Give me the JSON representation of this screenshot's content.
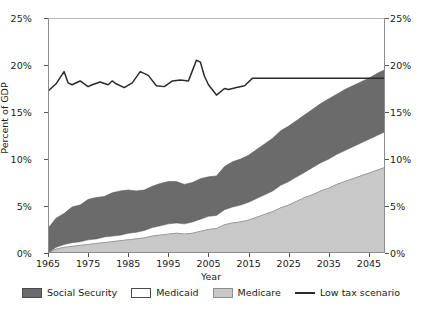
{
  "chart_data": {
    "type": "area",
    "title": "",
    "subtitle": "",
    "xlabel": "Year",
    "ylabel": "Percent of GDP",
    "xlim": [
      1965,
      2049
    ],
    "ylim": [
      0,
      25
    ],
    "grid": false,
    "legend_position": "bottom",
    "y_tick_labels": [
      "0%",
      "5%",
      "10%",
      "15%",
      "20%",
      "25%"
    ],
    "y_tick_values": [
      0,
      5,
      10,
      15,
      20,
      25
    ],
    "y_axis_right_labels": [
      "0%",
      "5%",
      "10%",
      "15%",
      "20%",
      "25%"
    ],
    "x_tick_labels": [
      "1965",
      "1975",
      "1985",
      "1995",
      "2005",
      "2015",
      "2025",
      "2035",
      "2045"
    ],
    "x_tick_values": [
      1965,
      1975,
      1985,
      1995,
      2005,
      2015,
      2025,
      2035,
      2045
    ],
    "stacked_order": [
      "Medicare",
      "Medicaid",
      "Social Security"
    ],
    "colors": {
      "social_security": "#6b6b6b",
      "medicaid": "#ffffff",
      "medicare": "#c8c8c8",
      "low_tax_scenario": "#2b2b2b",
      "axis": "#8c8c8c"
    },
    "x": [
      1965,
      1967,
      1969,
      1971,
      1973,
      1975,
      1977,
      1979,
      1981,
      1983,
      1985,
      1987,
      1989,
      1991,
      1993,
      1995,
      1997,
      1999,
      2001,
      2003,
      2005,
      2007,
      2009,
      2011,
      2013,
      2015,
      2017,
      2019,
      2021,
      2023,
      2025,
      2027,
      2029,
      2031,
      2033,
      2035,
      2037,
      2039,
      2041,
      2043,
      2045,
      2047,
      2049
    ],
    "series": [
      {
        "name": "Medicare",
        "values": [
          0.0,
          0.4,
          0.6,
          0.7,
          0.8,
          0.9,
          1.0,
          1.1,
          1.2,
          1.3,
          1.4,
          1.5,
          1.6,
          1.8,
          1.9,
          2.0,
          2.1,
          2.0,
          2.1,
          2.3,
          2.5,
          2.6,
          3.0,
          3.2,
          3.3,
          3.5,
          3.8,
          4.1,
          4.4,
          4.8,
          5.1,
          5.5,
          5.9,
          6.2,
          6.6,
          6.9,
          7.3,
          7.6,
          7.9,
          8.2,
          8.5,
          8.8,
          9.1
        ]
      },
      {
        "name": "Medicaid",
        "values": [
          0.0,
          0.2,
          0.3,
          0.4,
          0.4,
          0.5,
          0.5,
          0.6,
          0.6,
          0.6,
          0.7,
          0.7,
          0.8,
          0.9,
          1.0,
          1.1,
          1.1,
          1.1,
          1.2,
          1.3,
          1.4,
          1.4,
          1.6,
          1.7,
          1.8,
          1.9,
          2.0,
          2.1,
          2.2,
          2.4,
          2.5,
          2.6,
          2.7,
          2.9,
          3.0,
          3.1,
          3.2,
          3.3,
          3.4,
          3.5,
          3.6,
          3.7,
          3.8
        ]
      },
      {
        "name": "Social Security",
        "values": [
          2.6,
          3.1,
          3.3,
          3.8,
          3.9,
          4.3,
          4.4,
          4.3,
          4.6,
          4.7,
          4.6,
          4.4,
          4.3,
          4.4,
          4.5,
          4.5,
          4.4,
          4.2,
          4.2,
          4.3,
          4.2,
          4.2,
          4.6,
          4.8,
          4.9,
          5.0,
          5.2,
          5.4,
          5.6,
          5.8,
          5.9,
          6.0,
          6.1,
          6.2,
          6.3,
          6.4,
          6.4,
          6.5,
          6.5,
          6.5,
          6.5,
          6.6,
          6.6
        ]
      }
    ],
    "line_series": {
      "name": "Low tax scenario",
      "x": [
        1965,
        1967,
        1969,
        1970,
        1971,
        1973,
        1975,
        1976,
        1978,
        1980,
        1981,
        1982,
        1984,
        1986,
        1988,
        1990,
        1992,
        1994,
        1996,
        1998,
        2000,
        2001,
        2002,
        2003,
        2004,
        2005,
        2007,
        2009,
        2010,
        2012,
        2014,
        2016,
        2020,
        2030,
        2040,
        2049
      ],
      "values": [
        17.2,
        18.0,
        19.3,
        18.1,
        17.9,
        18.3,
        17.7,
        17.9,
        18.2,
        17.9,
        18.3,
        18.0,
        17.6,
        18.1,
        19.3,
        18.9,
        17.8,
        17.7,
        18.3,
        18.4,
        18.3,
        19.4,
        20.5,
        20.3,
        18.8,
        17.9,
        16.8,
        17.5,
        17.4,
        17.6,
        17.8,
        18.6,
        18.6,
        18.6,
        18.6,
        18.6
      ]
    }
  },
  "legend": {
    "items": [
      {
        "label": "Social Security",
        "swatch": "dark-gray-swatch"
      },
      {
        "label": "Medicaid",
        "swatch": "white-swatch"
      },
      {
        "label": "Medicare",
        "swatch": "light-gray-swatch"
      },
      {
        "label": "Low tax scenario",
        "swatch": "black-line-swatch"
      }
    ]
  }
}
